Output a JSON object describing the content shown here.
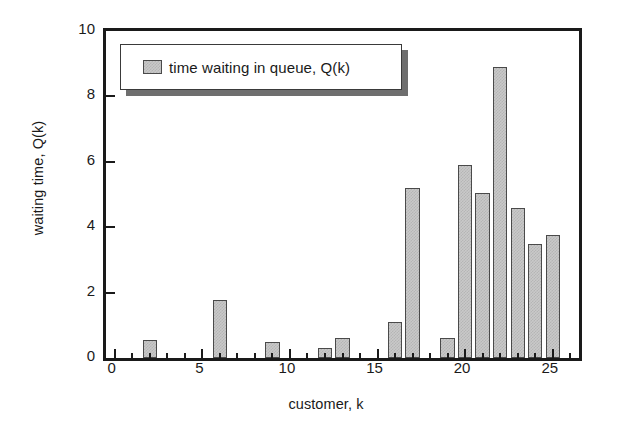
{
  "chart_data": {
    "type": "bar",
    "title": "",
    "xlabel": "customer, k",
    "ylabel": "waiting time, Q(k)",
    "xlim": [
      -0.5,
      26.5
    ],
    "ylim": [
      0,
      10
    ],
    "xticks": [
      "0",
      "5",
      "10",
      "15",
      "20",
      "25"
    ],
    "xtick_values": [
      0,
      5,
      10,
      15,
      20,
      25
    ],
    "xtick_minor_step": 1,
    "yticks": [
      "0",
      "2",
      "4",
      "6",
      "8",
      "10"
    ],
    "ytick_values": [
      0,
      2,
      4,
      6,
      8,
      10
    ],
    "grid": false,
    "legend_position": "upper left",
    "legend": [
      "time waiting in queue, Q(k)"
    ],
    "categories": [
      1,
      2,
      3,
      4,
      5,
      6,
      7,
      8,
      9,
      10,
      11,
      12,
      13,
      14,
      15,
      16,
      17,
      18,
      19,
      20,
      21,
      22,
      23,
      24,
      25
    ],
    "series": [
      {
        "name": "time waiting in queue, Q(k)",
        "values": [
          0,
          0.55,
          0,
          0,
          0,
          1.78,
          0,
          0,
          0.48,
          0,
          0,
          0.3,
          0.62,
          0,
          0,
          1.1,
          5.2,
          0,
          0.6,
          5.9,
          5.05,
          8.9,
          4.6,
          3.5,
          3.75
        ],
        "color": "#c9c9c9",
        "edge_color": "#4a4a4a",
        "hatch": "dither"
      }
    ]
  },
  "axes": {
    "y_title": "waiting time, Q(k)",
    "x_title": "customer, k"
  },
  "legend": {
    "label": "time waiting in queue, Q(k)"
  },
  "colors": {
    "bar_fill": "#c9c9c9",
    "bar_edge": "#4a4a4a",
    "axis": "#1a1a1a",
    "legend_shadow": "#6e6e6e",
    "background": "#ffffff"
  }
}
